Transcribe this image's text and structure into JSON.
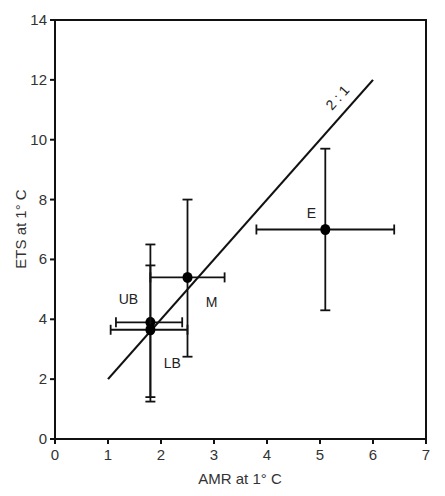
{
  "chart_data": {
    "type": "scatter",
    "title": "",
    "xlabel": "AMR at 1° C",
    "ylabel": "ETS at 1° C",
    "xlim": [
      0,
      7
    ],
    "ylim": [
      0,
      14
    ],
    "x_ticks": [
      "0",
      "1",
      "2",
      "3",
      "4",
      "5",
      "6",
      "7"
    ],
    "y_ticks": [
      "0",
      "2",
      "4",
      "6",
      "8",
      "10",
      "12",
      "14"
    ],
    "grid": false,
    "legend": null,
    "series": [
      {
        "name": "E",
        "x": 5.1,
        "y": 7.0,
        "x_err": [
          3.8,
          6.4
        ],
        "y_err": [
          4.3,
          9.7
        ]
      },
      {
        "name": "M",
        "x": 2.5,
        "y": 5.4,
        "x_err": [
          1.8,
          3.2
        ],
        "y_err": [
          2.75,
          8.0
        ]
      },
      {
        "name": "UB",
        "x": 1.8,
        "y": 3.9,
        "x_err": [
          1.15,
          2.4
        ],
        "y_err": [
          1.4,
          6.5
        ]
      },
      {
        "name": "LB",
        "x": 1.8,
        "y": 3.65,
        "x_err": [
          1.05,
          2.5
        ],
        "y_err": [
          1.25,
          5.8
        ]
      }
    ],
    "reference_line": {
      "label": "2 : 1",
      "x": [
        1,
        6
      ],
      "y": [
        2,
        12
      ]
    }
  }
}
